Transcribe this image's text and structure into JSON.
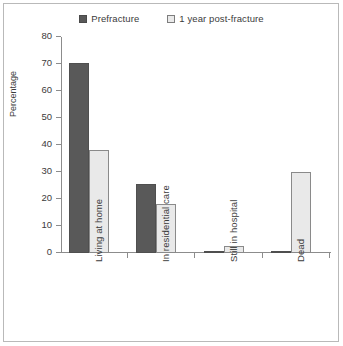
{
  "chart_data": {
    "type": "bar",
    "title": "",
    "subtitle": "",
    "xlabel": "",
    "ylabel": "Percentage",
    "ylim": [
      0,
      80
    ],
    "yticks": [
      0,
      10,
      20,
      30,
      40,
      50,
      60,
      70,
      80
    ],
    "ytick_labels": [
      "0",
      "10",
      "20",
      "30",
      "40",
      "50",
      "60",
      "70",
      "80"
    ],
    "grid": false,
    "legend_position": "top",
    "categories": [
      "Living at home",
      "In residential care",
      "Still in hospital",
      "Dead"
    ],
    "series": [
      {
        "name": "Prefracture",
        "color": "#595959",
        "values": [
          70.5,
          25.5,
          0.5,
          0.5
        ]
      },
      {
        "name": "1 year post-fracture",
        "color": "#e9e9e9",
        "values": [
          38,
          18,
          2.5,
          30
        ]
      }
    ]
  },
  "legend": {
    "items": [
      {
        "label": "Prefracture"
      },
      {
        "label": "1 year post-fracture"
      }
    ]
  },
  "axes": {
    "y_label": "Percentage",
    "y_ticks": [
      "0",
      "10",
      "20",
      "30",
      "40",
      "50",
      "60",
      "70",
      "80"
    ],
    "x_categories": [
      "Living at home",
      "In residential care",
      "Still in hospital",
      "Dead"
    ]
  },
  "colors": {
    "series_prefracture": "#595959",
    "series_postfracture": "#e9e9e9",
    "axis": "#8c8c8c",
    "text": "#3b3b3b",
    "frame": "#b9b9b9",
    "background": "#ffffff"
  }
}
